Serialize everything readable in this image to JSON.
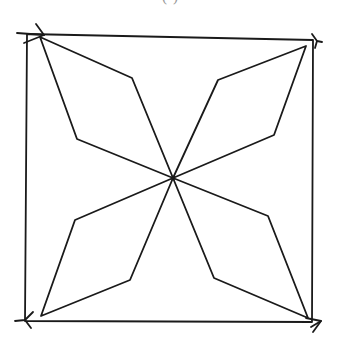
{
  "caption": {
    "text": "( )",
    "partially_visible": true
  },
  "figure": {
    "stroke_color": "#1a1a1a",
    "background": "#ffffff",
    "center": [
      173,
      178
    ],
    "square": {
      "corners": [
        [
          27,
          34
        ],
        [
          313,
          40
        ],
        [
          312,
          322
        ],
        [
          25,
          321
        ]
      ]
    },
    "corner_triangles": [
      {
        "name": "top-left",
        "points": [
          [
            36,
            24
          ],
          [
            44,
            35
          ],
          [
            17,
            33
          ],
          [
            24,
            43
          ]
        ]
      },
      {
        "name": "top-right",
        "points": [
          [
            312,
            34
          ],
          [
            317,
            41
          ],
          [
            322,
            42
          ],
          [
            315,
            48
          ]
        ]
      },
      {
        "name": "bottom-right",
        "points": [
          [
            306,
            318
          ],
          [
            321,
            321
          ],
          [
            311,
            327
          ],
          [
            313,
            332
          ]
        ]
      },
      {
        "name": "bottom-left",
        "points": [
          [
            33,
            312
          ],
          [
            25,
            320
          ],
          [
            15,
            321
          ],
          [
            31,
            328
          ]
        ]
      }
    ],
    "petals": [
      {
        "name": "top-left-petal",
        "points": [
          [
            173,
            178
          ],
          [
            132,
            78
          ],
          [
            40,
            37
          ],
          [
            77,
            139
          ]
        ]
      },
      {
        "name": "top-right-petal",
        "points": [
          [
            173,
            178
          ],
          [
            218,
            80
          ],
          [
            306,
            46
          ],
          [
            274,
            135
          ]
        ]
      },
      {
        "name": "bottom-right-petal",
        "points": [
          [
            173,
            178
          ],
          [
            268,
            216
          ],
          [
            308,
            318
          ],
          [
            214,
            278
          ]
        ]
      },
      {
        "name": "bottom-left-petal",
        "points": [
          [
            173,
            178
          ],
          [
            75,
            220
          ],
          [
            41,
            316
          ],
          [
            130,
            280
          ]
        ]
      }
    ]
  }
}
